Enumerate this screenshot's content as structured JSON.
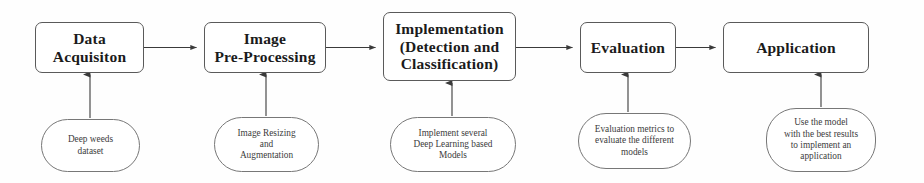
{
  "diagram": {
    "stroke_color": "#5a5a5a",
    "text_color": "#1b1b1b",
    "background_color": "#fefefe",
    "stages": [
      {
        "id": "data-acquisition",
        "label": "Data\nAcquisiton",
        "note": "Deep weeds\ndataset"
      },
      {
        "id": "image-pre-processing",
        "label": "Image\nPre-Processing",
        "note": "Image Resizing\nand\nAugmentation"
      },
      {
        "id": "implementation",
        "label": "Implementation\n(Detection and\nClassification)",
        "note": "Implement several\nDeep Learning based\nModels"
      },
      {
        "id": "evaluation",
        "label": "Evaluation",
        "note": "Evaluation metrics to\nevaluate the different\nmodels"
      },
      {
        "id": "application",
        "label": "Application",
        "note": "Use the model\nwith the best results\nto implement an\napplication"
      }
    ]
  }
}
